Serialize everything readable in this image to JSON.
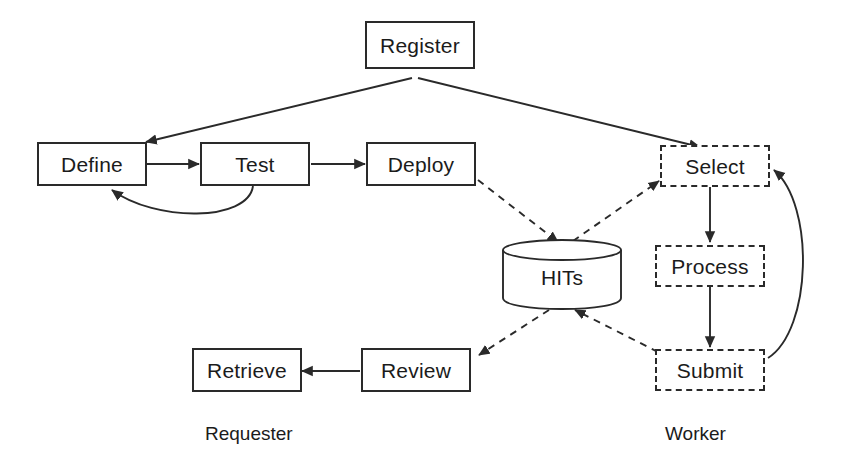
{
  "diagram": {
    "type": "flow-diagram",
    "background_color": "#ffffff",
    "stroke_color": "#2a2a2a",
    "text_color": "#1b1b1b"
  },
  "nodes": {
    "register": {
      "label": "Register",
      "shape": "rectangle",
      "border": "solid"
    },
    "define": {
      "label": "Define",
      "shape": "rectangle",
      "border": "solid"
    },
    "test": {
      "label": "Test",
      "shape": "rectangle",
      "border": "solid"
    },
    "deploy": {
      "label": "Deploy",
      "shape": "rectangle",
      "border": "solid"
    },
    "hits": {
      "label": "HITs",
      "shape": "cylinder",
      "border": "solid"
    },
    "select": {
      "label": "Select",
      "shape": "rectangle",
      "border": "dashed"
    },
    "process": {
      "label": "Process",
      "shape": "rectangle",
      "border": "dashed"
    },
    "submit": {
      "label": "Submit",
      "shape": "rectangle",
      "border": "dashed"
    },
    "review": {
      "label": "Review",
      "shape": "rectangle",
      "border": "solid"
    },
    "retrieve": {
      "label": "Retrieve",
      "shape": "rectangle",
      "border": "solid"
    }
  },
  "captions": {
    "requester": "Requester",
    "worker": "Worker"
  },
  "edges": [
    {
      "from": "register",
      "to": "define",
      "style": "solid"
    },
    {
      "from": "register",
      "to": "select",
      "style": "solid"
    },
    {
      "from": "define",
      "to": "test",
      "style": "solid"
    },
    {
      "from": "test",
      "to": "deploy",
      "style": "solid"
    },
    {
      "from": "test",
      "to": "define",
      "style": "solid-curved"
    },
    {
      "from": "deploy",
      "to": "hits",
      "style": "dashed"
    },
    {
      "from": "hits",
      "to": "select",
      "style": "dashed"
    },
    {
      "from": "select",
      "to": "process",
      "style": "solid"
    },
    {
      "from": "process",
      "to": "submit",
      "style": "solid"
    },
    {
      "from": "submit",
      "to": "hits",
      "style": "dashed"
    },
    {
      "from": "submit",
      "to": "select",
      "style": "solid-curved"
    },
    {
      "from": "hits",
      "to": "review",
      "style": "dashed"
    },
    {
      "from": "review",
      "to": "retrieve",
      "style": "solid"
    }
  ]
}
